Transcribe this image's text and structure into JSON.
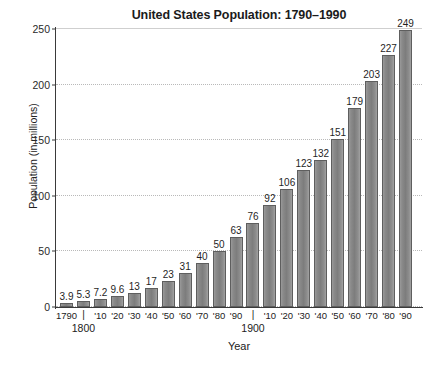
{
  "chart_data": {
    "type": "bar",
    "title": "United States Population: 1790–1990",
    "xlabel": "Year",
    "ylabel": "Population (in millions)",
    "ylim": [
      0,
      250
    ],
    "yticks": [
      0,
      50,
      100,
      150,
      200,
      250
    ],
    "grid": true,
    "legend": false,
    "categories": [
      "1790",
      "1800",
      "'10",
      "'20",
      "'30",
      "'40",
      "'50",
      "'60",
      "'70",
      "'80",
      "'90",
      "1900",
      "'10",
      "'20",
      "'30",
      "'40",
      "'50",
      "'60",
      "'70",
      "'80",
      "'90"
    ],
    "tick_labels": [
      "1790",
      "|",
      "'10",
      "'20",
      "'30",
      "'40",
      "'50",
      "'60",
      "'70",
      "'80",
      "'90",
      "|",
      "'10",
      "'20",
      "'30",
      "'40",
      "'50",
      "'60",
      "'70",
      "'80",
      "'90"
    ],
    "sub_labels": {
      "1": "1800",
      "11": "1900"
    },
    "values": [
      3.9,
      5.3,
      7.2,
      9.6,
      13,
      17,
      23,
      31,
      40,
      50,
      63,
      76,
      92,
      106,
      123,
      132,
      151,
      179,
      203,
      227,
      249
    ],
    "value_labels": [
      "3.9",
      "5.3",
      "7.2",
      "9.6",
      "13",
      "17",
      "23",
      "31",
      "40",
      "50",
      "63",
      "76",
      "92",
      "106",
      "123",
      "132",
      "151",
      "179",
      "203",
      "227",
      "249"
    ],
    "bar_color": "#848484",
    "bar_edge_color": "#5e5e5e",
    "grid_color": "#b9b9b9",
    "axis_color": "#3a3a3a",
    "text_color": "#1f1f1f"
  }
}
